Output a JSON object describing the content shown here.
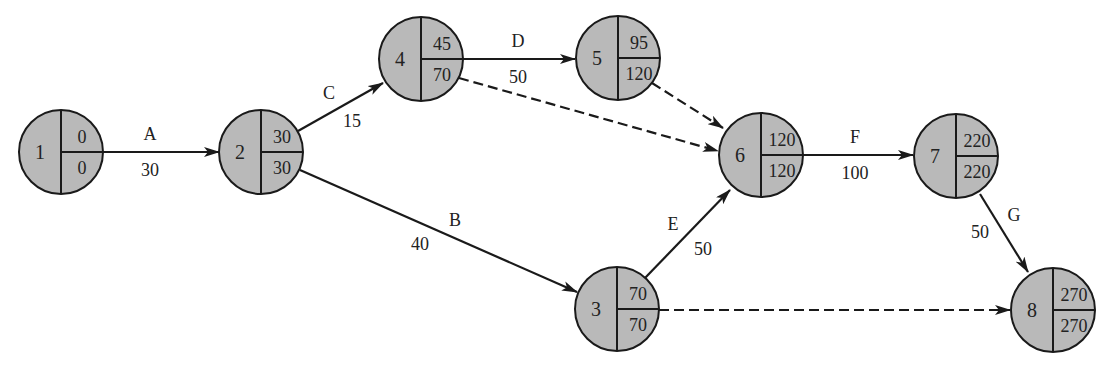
{
  "diagram": {
    "type": "activity-on-arrow network (CPM)",
    "colors": {
      "node_fill": "#b9b9b9",
      "stroke": "#1a1a1a",
      "text": "#222222"
    },
    "nodes": [
      {
        "id": "1",
        "cx": 61,
        "cy": 152,
        "top": "0",
        "bottom": "0"
      },
      {
        "id": "2",
        "cx": 261,
        "cy": 152,
        "top": "30",
        "bottom": "30"
      },
      {
        "id": "3",
        "cx": 617,
        "cy": 309,
        "top": "70",
        "bottom": "70"
      },
      {
        "id": "4",
        "cx": 421,
        "cy": 59,
        "top": "45",
        "bottom": "70"
      },
      {
        "id": "5",
        "cx": 618,
        "cy": 58,
        "top": "95",
        "bottom": "120"
      },
      {
        "id": "6",
        "cx": 761,
        "cy": 155,
        "top": "120",
        "bottom": "120"
      },
      {
        "id": "7",
        "cx": 956,
        "cy": 156,
        "top": "220",
        "bottom": "220"
      },
      {
        "id": "8",
        "cx": 1053,
        "cy": 310,
        "top": "270",
        "bottom": "270"
      }
    ],
    "node_radius": 42,
    "edges": [
      {
        "from": "1",
        "to": "2",
        "activity": "A",
        "duration": "30",
        "dashed": false,
        "x1": 103,
        "y1": 152,
        "x2": 219,
        "y2": 152,
        "name_pos": [
          150,
          140
        ],
        "dur_pos": [
          150,
          176
        ]
      },
      {
        "from": "2",
        "to": "4",
        "activity": "C",
        "duration": "15",
        "dashed": false,
        "x1": 298,
        "y1": 131,
        "x2": 383,
        "y2": 83,
        "name_pos": [
          329,
          99
        ],
        "dur_pos": [
          352,
          127
        ]
      },
      {
        "from": "2",
        "to": "3",
        "activity": "B",
        "duration": "40",
        "dashed": false,
        "x1": 300,
        "y1": 170,
        "x2": 577,
        "y2": 292,
        "name_pos": [
          455,
          226
        ],
        "dur_pos": [
          420,
          250
        ]
      },
      {
        "from": "4",
        "to": "5",
        "activity": "D",
        "duration": "50",
        "dashed": false,
        "x1": 463,
        "y1": 59,
        "x2": 575,
        "y2": 59,
        "name_pos": [
          518,
          47
        ],
        "dur_pos": [
          518,
          83
        ]
      },
      {
        "from": "4",
        "to": "6",
        "activity": "",
        "duration": "",
        "dashed": true,
        "x1": 459,
        "y1": 78,
        "x2": 718,
        "y2": 151,
        "name_pos": [
          0,
          0
        ],
        "dur_pos": [
          0,
          0
        ]
      },
      {
        "from": "5",
        "to": "6",
        "activity": "",
        "duration": "",
        "dashed": true,
        "x1": 652,
        "y1": 83,
        "x2": 723,
        "y2": 128,
        "name_pos": [
          0,
          0
        ],
        "dur_pos": [
          0,
          0
        ]
      },
      {
        "from": "3",
        "to": "6",
        "activity": "E",
        "duration": "50",
        "dashed": false,
        "x1": 645,
        "y1": 278,
        "x2": 730,
        "y2": 190,
        "name_pos": [
          673,
          230
        ],
        "dur_pos": [
          703,
          255
        ]
      },
      {
        "from": "6",
        "to": "7",
        "activity": "F",
        "duration": "100",
        "dashed": false,
        "x1": 803,
        "y1": 155,
        "x2": 913,
        "y2": 155,
        "name_pos": [
          855,
          143
        ],
        "dur_pos": [
          855,
          179
        ]
      },
      {
        "from": "7",
        "to": "8",
        "activity": "G",
        "duration": "50",
        "dashed": false,
        "x1": 980,
        "y1": 194,
        "x2": 1028,
        "y2": 272,
        "name_pos": [
          1014,
          221
        ],
        "dur_pos": [
          980,
          238
        ]
      },
      {
        "from": "3",
        "to": "8",
        "activity": "",
        "duration": "",
        "dashed": true,
        "x1": 659,
        "y1": 310,
        "x2": 1010,
        "y2": 310,
        "name_pos": [
          0,
          0
        ],
        "dur_pos": [
          0,
          0
        ]
      }
    ]
  }
}
